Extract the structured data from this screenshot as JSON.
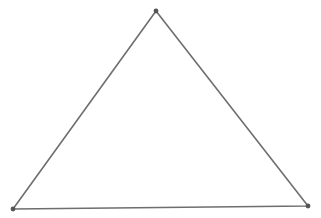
{
  "diagram": {
    "type": "triangle",
    "background": "#ffffff",
    "stroke_color": "#6e6e6e",
    "vertex_color": "#555555",
    "vertices": [
      {
        "name": "top",
        "x": 156,
        "y": 11
      },
      {
        "name": "bottom-left",
        "x": 13,
        "y": 209
      },
      {
        "name": "bottom-right",
        "x": 308,
        "y": 206
      }
    ]
  }
}
